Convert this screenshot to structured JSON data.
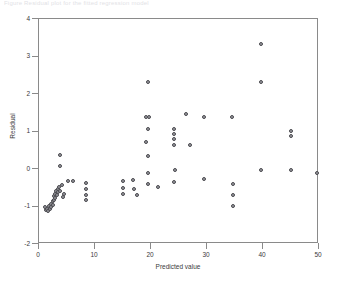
{
  "header": {
    "clipped_caption": "Figure  Residual  plot  for  the  fitted  regression  model"
  },
  "chart_data": {
    "type": "scatter",
    "title": "",
    "xlabel": "Predicted value",
    "ylabel": "Residual",
    "xlim": [
      0,
      50
    ],
    "ylim": [
      -2,
      4
    ],
    "xticks": [
      0,
      10,
      20,
      30,
      40,
      50
    ],
    "yticks": [
      -2,
      -1,
      0,
      1,
      2,
      3,
      4
    ],
    "xtick_labels": [
      "0",
      "10",
      "20",
      "30",
      "40",
      "50"
    ],
    "ytick_labels": [
      "-2",
      "-1",
      "0",
      "1",
      "2",
      "3",
      "4"
    ],
    "grid": false,
    "legend": null,
    "marker": {
      "shape": "circle",
      "size_px": 4,
      "edge_color": "#4a4a4f",
      "fill_color": "#9a9aa0"
    },
    "axes_color": "#8a8a8a",
    "background": "#ffffff",
    "series": [
      {
        "name": "residuals",
        "points": [
          [
            1.2,
            -1.05
          ],
          [
            1.4,
            -1.12
          ],
          [
            1.6,
            -1.08
          ],
          [
            1.8,
            -1.15
          ],
          [
            2.0,
            -1.0
          ],
          [
            2.1,
            -1.1
          ],
          [
            2.3,
            -0.95
          ],
          [
            2.4,
            -1.05
          ],
          [
            2.6,
            -0.88
          ],
          [
            2.7,
            -0.98
          ],
          [
            2.8,
            -0.75
          ],
          [
            2.9,
            -0.85
          ],
          [
            3.0,
            -0.7
          ],
          [
            3.1,
            -0.8
          ],
          [
            3.2,
            -0.62
          ],
          [
            3.4,
            -0.72
          ],
          [
            3.5,
            -0.55
          ],
          [
            3.6,
            -0.65
          ],
          [
            3.8,
            -0.5
          ],
          [
            4.0,
            -0.6
          ],
          [
            4.2,
            -0.45
          ],
          [
            4.4,
            -0.78
          ],
          [
            4.6,
            -0.7
          ],
          [
            3.9,
            0.35
          ],
          [
            4.0,
            0.05
          ],
          [
            5.4,
            -0.35
          ],
          [
            6.2,
            -0.35
          ],
          [
            8.6,
            -0.4
          ],
          [
            8.6,
            -0.55
          ],
          [
            8.6,
            -0.72
          ],
          [
            8.6,
            -0.85
          ],
          [
            15.2,
            -0.35
          ],
          [
            15.2,
            -0.52
          ],
          [
            15.2,
            -0.68
          ],
          [
            17.0,
            -0.32
          ],
          [
            17.2,
            -0.55
          ],
          [
            17.6,
            -0.72
          ],
          [
            19.6,
            2.3
          ],
          [
            19.3,
            1.35
          ],
          [
            19.9,
            1.35
          ],
          [
            19.6,
            1.05
          ],
          [
            19.2,
            0.7
          ],
          [
            19.6,
            0.32
          ],
          [
            19.6,
            -0.12
          ],
          [
            19.6,
            -0.42
          ],
          [
            24.2,
            1.05
          ],
          [
            24.2,
            0.92
          ],
          [
            24.2,
            0.78
          ],
          [
            24.2,
            0.62
          ],
          [
            24.4,
            -0.05
          ],
          [
            24.2,
            -0.38
          ],
          [
            21.4,
            -0.5
          ],
          [
            26.4,
            1.45
          ],
          [
            27.2,
            0.62
          ],
          [
            29.6,
            1.35
          ],
          [
            29.6,
            -0.3
          ],
          [
            34.6,
            1.35
          ],
          [
            34.8,
            -0.42
          ],
          [
            34.8,
            -0.72
          ],
          [
            34.8,
            -1.0
          ],
          [
            39.8,
            3.3
          ],
          [
            39.8,
            2.3
          ],
          [
            39.8,
            -0.05
          ],
          [
            45.2,
            1.0
          ],
          [
            45.2,
            0.85
          ],
          [
            45.2,
            -0.05
          ],
          [
            49.8,
            -0.12
          ]
        ]
      }
    ]
  }
}
